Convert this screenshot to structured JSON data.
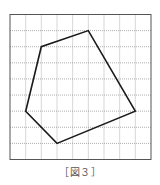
{
  "figure": {
    "caption": "［図３］",
    "grid": {
      "columns": 9,
      "rows": 9,
      "left": 10,
      "top": 14.5,
      "width": 141,
      "height": 145,
      "border_color": "#555555",
      "grid_color": "#9a9a9a"
    },
    "polygon": {
      "stroke_color": "#1a1a1a",
      "vertices_grid": [
        [
          1,
          6
        ],
        [
          2,
          2
        ],
        [
          5,
          1
        ],
        [
          8,
          6
        ],
        [
          3,
          8
        ]
      ]
    }
  }
}
